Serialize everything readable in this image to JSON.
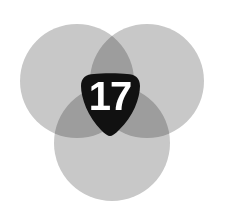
{
  "figure": {
    "kind": "venn-trefoil-badge",
    "width": 227,
    "height": 220,
    "background_color": "#ffffff"
  },
  "venn": {
    "circle_fill": "#c8c8c8",
    "overlap_two_color": "#9c9c9c",
    "overlap_three_color": "#7b7b7b",
    "circles": [
      {
        "label": "top-left-circle",
        "cx": 77,
        "cy": 81,
        "r": 57
      },
      {
        "label": "top-right-circle",
        "cx": 147,
        "cy": 81,
        "r": 57
      },
      {
        "label": "bottom-circle",
        "cx": 112,
        "cy": 143,
        "r": 58
      }
    ]
  },
  "badge": {
    "shape": "rounded-triangle-shield",
    "fill_color": "#111111",
    "text_color": "#ffffff",
    "value": "17",
    "cx": 110,
    "cy": 103
  }
}
